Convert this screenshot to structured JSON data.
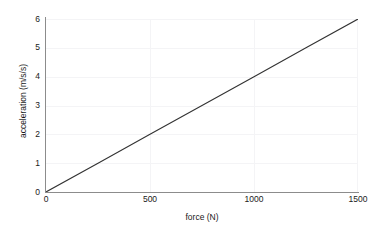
{
  "chart_data": {
    "type": "line",
    "title": "",
    "xlabel": "force (N)",
    "ylabel": "acceleration (m/s/s)",
    "xlim": [
      0,
      1500
    ],
    "ylim": [
      0,
      6
    ],
    "xticks": [
      0,
      500,
      1000,
      1500
    ],
    "xtick_labels": [
      "0",
      "500",
      "1000",
      "1500"
    ],
    "yticks": [
      0,
      1,
      2,
      3,
      4,
      5,
      6
    ],
    "ytick_labels": [
      "0",
      "1",
      "2",
      "3",
      "4",
      "5",
      "6"
    ],
    "grid": true,
    "legend": null,
    "series": [
      {
        "name": "acceleration vs force",
        "x": [
          0,
          250,
          500,
          750,
          1000,
          1250,
          1500
        ],
        "y": [
          0,
          1,
          2,
          3,
          4,
          5,
          6
        ],
        "color": "#333333",
        "linewidth": 1
      }
    ],
    "annotations": [],
    "slope": 0.004,
    "intercept": 0
  },
  "axes": {
    "x_title": "force (N)",
    "y_title": "acceleration (m/s/s)",
    "x_tick_labels": [
      "0",
      "500",
      "1000",
      "1500"
    ],
    "y_tick_labels": [
      "0",
      "1",
      "2",
      "3",
      "4",
      "5",
      "6"
    ]
  },
  "colors": {
    "background": "#ffffff",
    "axis": "#8c8c8c",
    "grid": "#f4f4f6",
    "line": "#333333",
    "text": "#1a1a1a"
  }
}
